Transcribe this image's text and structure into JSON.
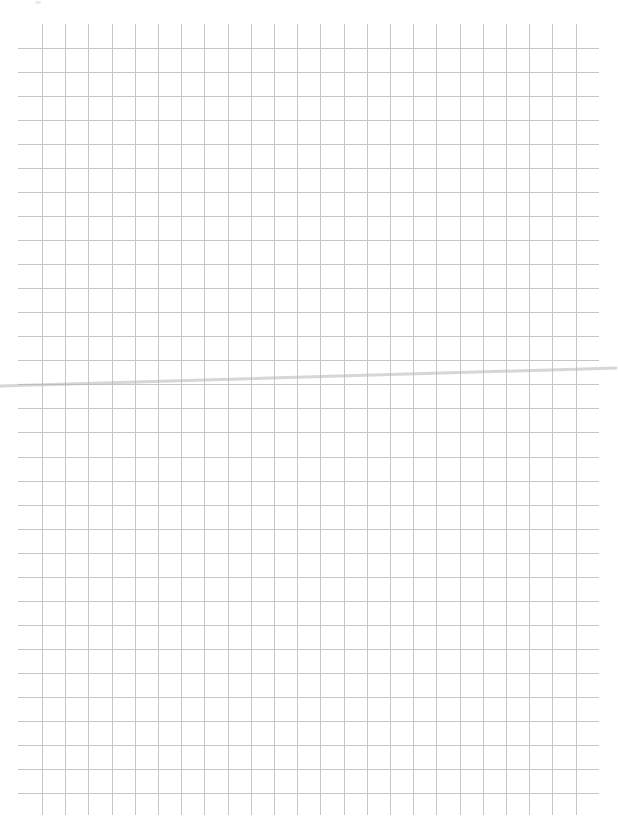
{
  "page": {
    "type": "graph-paper-scan",
    "width": 618,
    "height": 834,
    "background_color": "#ffffff"
  },
  "grid": {
    "line_color": "#c6c6c6",
    "line_width": 1,
    "vertical_lines": {
      "count": 24,
      "first_x": 42,
      "spacing": 23.2,
      "y_start": 24,
      "y_end": 815
    },
    "horizontal_lines": {
      "count": 32,
      "first_y": 48,
      "spacing": 24.03,
      "x_start": 18,
      "x_end": 599
    }
  },
  "crease": {
    "color": "#b4b4b4",
    "opacity": 0.55,
    "thickness": 3,
    "from": [
      0,
      386
    ],
    "to": [
      616,
      368
    ]
  }
}
